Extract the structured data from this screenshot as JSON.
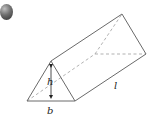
{
  "figure": {
    "bullet_icon": "gray-sphere-bullet",
    "labels": {
      "height": "h",
      "base": "b",
      "length": "l"
    },
    "colors": {
      "edge": "#6a6a6a",
      "hidden_edge": "#a0a0a0",
      "label": "#222222"
    }
  }
}
